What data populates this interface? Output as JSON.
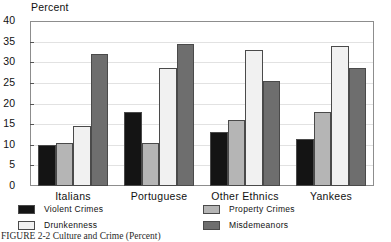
{
  "figure": {
    "caption": "FIGURE 2-2  Culture and Crime (Percent)",
    "axis_title": "Percent"
  },
  "chart_data": {
    "type": "bar",
    "title": "",
    "subtitle": "",
    "xlabel": "",
    "ylabel": "Percent",
    "ylim": [
      0,
      40
    ],
    "ytick_step": 5,
    "yticks": [
      "40",
      "35",
      "30",
      "25",
      "20",
      "15",
      "10",
      "5",
      "0"
    ],
    "grid": true,
    "legend_position": "bottom",
    "categories": [
      "Italians",
      "Portuguese",
      "Other Ethnics",
      "Yankees"
    ],
    "series": [
      {
        "name": "Violent Crimes",
        "color": "#141414",
        "values": [
          10,
          18,
          13,
          11.5
        ]
      },
      {
        "name": "Drunkenness",
        "color": "#f1f1f1",
        "values": [
          14.5,
          28.5,
          33,
          34
        ]
      },
      {
        "name": "Property Crimes",
        "color": "#b5b5b5",
        "values": [
          10.5,
          10.5,
          16,
          18
        ]
      },
      {
        "name": "Misdemeanors",
        "color": "#6e6e6e",
        "values": [
          32,
          34.5,
          25.5,
          28.5
        ]
      }
    ],
    "series_draw_order": [
      "Violent Crimes",
      "Property Crimes",
      "Drunkenness",
      "Misdemeanors"
    ]
  },
  "legend": {
    "entries": [
      {
        "label": "Violent Crimes",
        "swatch": "violent"
      },
      {
        "label": "Property Crimes",
        "swatch": "property"
      },
      {
        "label": "Drunkenness",
        "swatch": "drunk"
      },
      {
        "label": "Misdemeanors",
        "swatch": "misd"
      }
    ]
  }
}
